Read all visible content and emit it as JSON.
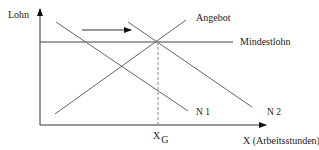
{
  "diagram": {
    "y_axis_label": "Lohn",
    "x_axis_label": "X (Arbeitsstunden)",
    "min_wage_label": "Mindestlohn",
    "supply_label": "Angebot",
    "demand1_label": "N 1",
    "demand2_label": "N 2",
    "equilibrium_label_main": "X",
    "equilibrium_label_sub": "G",
    "colors": {
      "axis": "#333333",
      "curve": "#666666",
      "min_wage_line": "#444444",
      "dashed_line": "#888888",
      "text": "#222222"
    }
  }
}
